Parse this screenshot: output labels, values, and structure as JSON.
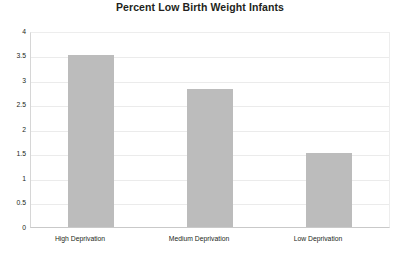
{
  "chart_data": {
    "type": "bar",
    "title": "Percent Low Birth Weight Infants",
    "xlabel": "",
    "ylabel": "",
    "categories": [
      "High Deprivation",
      "Medium Deprivation",
      "Low Deprivation"
    ],
    "values": [
      3.55,
      2.84,
      1.52
    ],
    "ylim": [
      0,
      4
    ],
    "ytick_labels": [
      "4",
      "3.5",
      "3",
      "2.5",
      "2",
      "1.5",
      "1",
      "0.5",
      "0"
    ],
    "ytick_values": [
      4,
      3.5,
      3,
      2.5,
      2,
      1.5,
      1,
      0.5,
      0
    ],
    "grid": true,
    "legend": false,
    "legend_position": "none",
    "bar_color": "#bcbcbc",
    "gridline_color": "#ebebeb",
    "text_color": "#231f20"
  }
}
